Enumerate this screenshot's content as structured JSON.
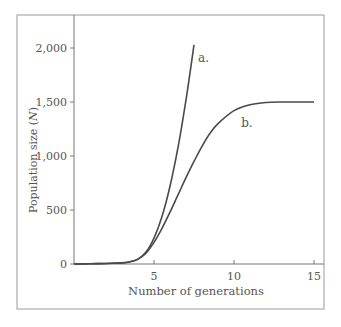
{
  "chart_data": {
    "type": "line",
    "title": "",
    "xlabel": "Number of generations",
    "ylabel": "Population size (N)",
    "ylabel_main": "Population size (",
    "ylabel_var": "N",
    "ylabel_close": ")",
    "xlim": [
      0,
      15.2
    ],
    "ylim": [
      0,
      2250
    ],
    "xticks": [
      5,
      10,
      15
    ],
    "xtick_labels": [
      "5",
      "10",
      "15"
    ],
    "yticks": [
      0,
      500,
      1000,
      1500,
      2000
    ],
    "ytick_labels": [
      "0",
      "500",
      "1,000",
      "1,500",
      "2,000"
    ],
    "grid": false,
    "legend": "none (curves labeled directly)",
    "series": [
      {
        "name": "a.",
        "description": "exponential growth",
        "x": [
          0,
          1,
          2,
          3,
          3.5,
          4,
          4.5,
          5,
          5.5,
          6,
          6.5,
          7,
          7.5
        ],
        "y": [
          0,
          2,
          5,
          10,
          20,
          45,
          110,
          240,
          440,
          720,
          1080,
          1520,
          2030
        ]
      },
      {
        "name": "b.",
        "description": "logistic growth, carrying capacity 1,500",
        "x": [
          0,
          1,
          2,
          3,
          3.5,
          4,
          4.5,
          5,
          5.5,
          6,
          6.5,
          7,
          7.5,
          8,
          8.5,
          9,
          10,
          11,
          12,
          13,
          14,
          15
        ],
        "y": [
          0,
          2,
          5,
          10,
          20,
          45,
          100,
          200,
          330,
          480,
          640,
          800,
          950,
          1090,
          1210,
          1300,
          1420,
          1475,
          1495,
          1500,
          1500,
          1500
        ]
      }
    ],
    "annotations": [
      {
        "text": "a.",
        "x": 7.75,
        "y": 1870
      },
      {
        "text": "b.",
        "x": 10.45,
        "y": 1270
      }
    ],
    "colors": {
      "curve": "#4a4a4a",
      "axis": "#777777",
      "frame": "#999999",
      "text": "#555555"
    }
  }
}
